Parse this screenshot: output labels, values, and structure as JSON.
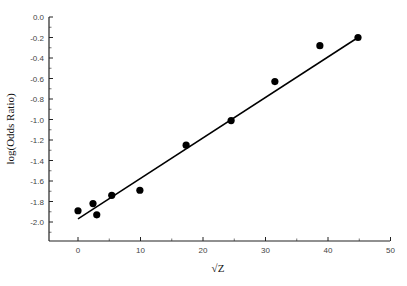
{
  "chart_data": {
    "type": "scatter",
    "title": "",
    "xlabel": "√Z",
    "ylabel": "log(Odds Ratio)",
    "xlim": [
      -5,
      50
    ],
    "ylim": [
      -2.18,
      0.0
    ],
    "xticks": [
      0,
      10,
      20,
      30,
      40,
      50
    ],
    "xtick_labels": [
      "0",
      "10",
      "20",
      "30",
      "40",
      "50"
    ],
    "yticks": [
      0.0,
      -0.2,
      -0.4,
      -0.6,
      -0.8,
      -1.0,
      -1.2,
      -1.4,
      -1.6,
      -1.8,
      -2.0
    ],
    "ytick_labels": [
      "0.0",
      "-0.2",
      "-0.4",
      "-0.6",
      "-0.8",
      "-1.0",
      "-1.2",
      "-1.4",
      "-1.6",
      "-1.8",
      "-2.0"
    ],
    "grid": false,
    "legend": null,
    "series": [
      {
        "name": "data",
        "kind": "scatter",
        "marker": "filled-circle",
        "color": "#000000",
        "x": [
          0.0,
          2.4,
          3.0,
          5.4,
          9.9,
          17.3,
          24.5,
          31.5,
          38.7,
          44.8
        ],
        "y": [
          -1.89,
          -1.82,
          -1.93,
          -1.74,
          -1.69,
          -1.25,
          -1.01,
          -0.63,
          -0.28,
          -0.2
        ]
      },
      {
        "name": "linear fit",
        "kind": "line",
        "color": "#000000",
        "x": [
          0.0,
          44.8
        ],
        "y": [
          -1.97,
          -0.2
        ]
      }
    ]
  }
}
